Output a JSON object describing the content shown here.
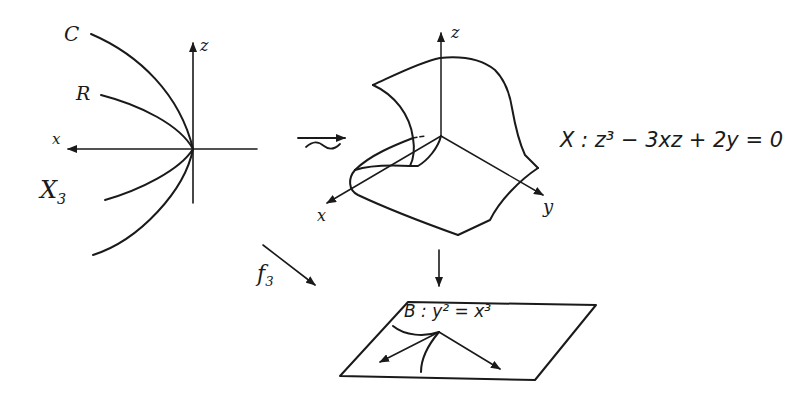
{
  "left_panel": {
    "name": "X_3",
    "labels": {
      "curve_c": "C",
      "curve_r": "R",
      "x_axis": "x",
      "z_axis": "z",
      "space_name": "X",
      "space_sub": "3"
    }
  },
  "isomorphism_symbol": "≃",
  "middle_panel": {
    "labels": {
      "x_axis": "x",
      "y_axis": "y",
      "z_axis": "z"
    },
    "equation": "X : z³ − 3xz + 2y = 0"
  },
  "map_label": {
    "base": "f",
    "sub": "3"
  },
  "bottom_panel": {
    "equation": "B : y² = x³"
  },
  "colors": {
    "ink": "#1a1a1a",
    "background": "#ffffff"
  }
}
